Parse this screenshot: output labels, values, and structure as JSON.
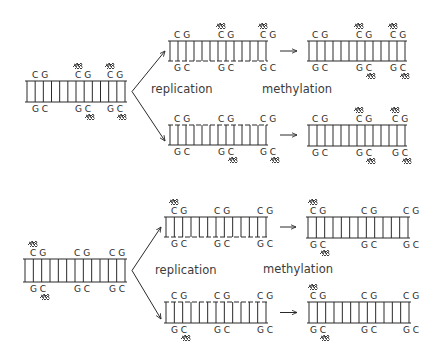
{
  "diagram": {
    "colors": {
      "ink": "#2a2a2a",
      "label": "#3a3a3a",
      "background": "#ffffff"
    },
    "labels": {
      "top_replication": "replication",
      "top_methylation": "methylation",
      "bottom_replication": "replication",
      "bottom_methylation": "methylation"
    },
    "base_pairs": {
      "top_strand": "CG",
      "bottom_strand": "GC"
    },
    "methyl_glyph": "methyl-group-icon",
    "panels": [
      {
        "name": "panel-1",
        "parent": {
          "x": 25,
          "y_top": 81,
          "y_bot": 102,
          "width": 102,
          "rungs": 13,
          "cpg_sites": [
            {
              "x": 32,
              "top_methyl": false,
              "bottom_methyl": false
            },
            {
              "x": 75,
              "top_methyl": true,
              "bottom_methyl": true
            },
            {
              "x": 107,
              "top_methyl": true,
              "bottom_methyl": true
            }
          ]
        },
        "daughters": [
          {
            "name": "daughter-upper",
            "after_replication": {
              "x": 168,
              "y_top": 41,
              "y_bot": 61,
              "width": 100,
              "rungs": 13,
              "new_strand": "bottom",
              "cpg_sites": [
                {
                  "x": 174,
                  "top_methyl": false,
                  "bottom_methyl": false
                },
                {
                  "x": 218,
                  "top_methyl": true,
                  "bottom_methyl": false
                },
                {
                  "x": 260,
                  "top_methyl": true,
                  "bottom_methyl": false
                }
              ]
            },
            "after_methylation": {
              "x": 307,
              "y_top": 41,
              "y_bot": 61,
              "width": 100,
              "rungs": 13,
              "cpg_sites": [
                {
                  "x": 312,
                  "top_methyl": false,
                  "bottom_methyl": false
                },
                {
                  "x": 356,
                  "top_methyl": true,
                  "bottom_methyl": true
                },
                {
                  "x": 390,
                  "top_methyl": true,
                  "bottom_methyl": true
                }
              ]
            }
          },
          {
            "name": "daughter-lower",
            "after_replication": {
              "x": 168,
              "y_top": 125,
              "y_bot": 145,
              "width": 100,
              "rungs": 13,
              "new_strand": "top",
              "cpg_sites": [
                {
                  "x": 174,
                  "top_methyl": false,
                  "bottom_methyl": false
                },
                {
                  "x": 218,
                  "top_methyl": false,
                  "bottom_methyl": true
                },
                {
                  "x": 260,
                  "top_methyl": false,
                  "bottom_methyl": true
                }
              ]
            },
            "after_methylation": {
              "x": 307,
              "y_top": 125,
              "y_bot": 146,
              "width": 100,
              "rungs": 13,
              "cpg_sites": [
                {
                  "x": 312,
                  "top_methyl": false,
                  "bottom_methyl": false
                },
                {
                  "x": 356,
                  "top_methyl": true,
                  "bottom_methyl": true
                },
                {
                  "x": 392,
                  "top_methyl": true,
                  "bottom_methyl": true
                }
              ]
            }
          }
        ]
      },
      {
        "name": "panel-2",
        "parent": {
          "x": 23,
          "y_top": 259,
          "y_bot": 282,
          "width": 104,
          "rungs": 13,
          "cpg_sites": [
            {
              "x": 30,
              "top_methyl": true,
              "bottom_methyl": true
            },
            {
              "x": 74,
              "top_methyl": false,
              "bottom_methyl": false
            },
            {
              "x": 109,
              "top_methyl": false,
              "bottom_methyl": false
            }
          ]
        },
        "daughters": [
          {
            "name": "daughter-upper",
            "after_replication": {
              "x": 164,
              "y_top": 217,
              "y_bot": 237,
              "width": 104,
              "rungs": 13,
              "new_strand": "bottom",
              "cpg_sites": [
                {
                  "x": 171,
                  "top_methyl": true,
                  "bottom_methyl": false
                },
                {
                  "x": 214,
                  "top_methyl": false,
                  "bottom_methyl": false
                },
                {
                  "x": 257,
                  "top_methyl": false,
                  "bottom_methyl": false
                }
              ]
            },
            "after_methylation": {
              "x": 306,
              "y_top": 217,
              "y_bot": 238,
              "width": 104,
              "rungs": 13,
              "cpg_sites": [
                {
                  "x": 310,
                  "top_methyl": true,
                  "bottom_methyl": true
                },
                {
                  "x": 361,
                  "top_methyl": false,
                  "bottom_methyl": false
                },
                {
                  "x": 403,
                  "top_methyl": false,
                  "bottom_methyl": false
                }
              ]
            }
          },
          {
            "name": "daughter-lower",
            "after_replication": {
              "x": 164,
              "y_top": 302,
              "y_bot": 323,
              "width": 104,
              "rungs": 13,
              "new_strand": "top",
              "cpg_sites": [
                {
                  "x": 171,
                  "top_methyl": false,
                  "bottom_methyl": true
                },
                {
                  "x": 214,
                  "top_methyl": false,
                  "bottom_methyl": false
                },
                {
                  "x": 257,
                  "top_methyl": false,
                  "bottom_methyl": false
                }
              ]
            },
            "after_methylation": {
              "x": 307,
              "y_top": 302,
              "y_bot": 323,
              "width": 104,
              "rungs": 13,
              "cpg_sites": [
                {
                  "x": 310,
                  "top_methyl": true,
                  "bottom_methyl": true
                },
                {
                  "x": 361,
                  "top_methyl": false,
                  "bottom_methyl": false
                },
                {
                  "x": 403,
                  "top_methyl": false,
                  "bottom_methyl": false
                }
              ]
            }
          }
        ]
      }
    ]
  }
}
